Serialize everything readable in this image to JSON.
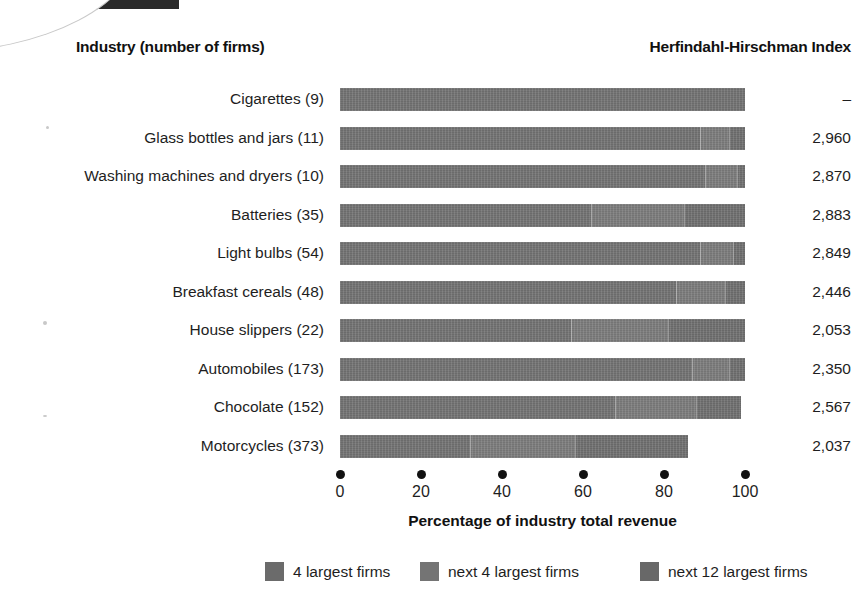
{
  "headers": {
    "industry": "Industry (number of firms)",
    "hhi": "Herfindahl-Hirschman Index"
  },
  "chart_data": {
    "type": "bar",
    "orientation": "horizontal",
    "stacked": true,
    "title": "",
    "xlabel": "Percentage of industry total revenue",
    "ylabel": "Industry (number of firms)",
    "xlim": [
      0,
      100
    ],
    "xticks": [
      0,
      20,
      40,
      60,
      80,
      100
    ],
    "xtick_labels": [
      "0",
      "20",
      "40",
      "60",
      "80",
      "100"
    ],
    "grid": false,
    "legend_position": "bottom",
    "legend": [
      "4 largest firms",
      "next 4 largest firms",
      "next 12 largest firms"
    ],
    "series": [
      {
        "name": "4 largest firms",
        "values": [
          100,
          89,
          90,
          62,
          89,
          83,
          57,
          87,
          68,
          32
        ]
      },
      {
        "name": "next 4 largest firms",
        "values": [
          0,
          7,
          8,
          23,
          8,
          12,
          24,
          9,
          20,
          26
        ]
      },
      {
        "name": "next 12 largest firms",
        "values": [
          0,
          4,
          2,
          15,
          3,
          5,
          19,
          4,
          11,
          28
        ]
      }
    ],
    "categories": [
      "Cigarettes  (9)",
      "Glass bottles and jars  (11)",
      "Washing machines and dryers  (10)",
      "Batteries  (35)",
      "Light bulbs  (54)",
      "Breakfast cereals  (48)",
      "House slippers  (22)",
      "Automobiles  (173)",
      "Chocolate  (152)",
      "Motorcycles  (373)"
    ],
    "totals": [
      100,
      100,
      100,
      100,
      100,
      100,
      100,
      100,
      99,
      86
    ],
    "hhi_values": [
      "–",
      "2,960",
      "2,870",
      "2,883",
      "2,849",
      "2,446",
      "2,053",
      "2,350",
      "2,567",
      "2,037"
    ],
    "colors": {
      "segment_1": "#6b6b6b",
      "segment_2": "#747474",
      "segment_3": "#686868",
      "text": "#1e1e1e",
      "background": "#ffffff"
    }
  },
  "rows": [
    {
      "label": "Cigarettes  (9)",
      "segments": [
        100,
        0,
        0
      ],
      "hhi": "–"
    },
    {
      "label": "Glass bottles and jars  (11)",
      "segments": [
        89,
        7,
        4
      ],
      "hhi": "2,960"
    },
    {
      "label": "Washing machines and dryers  (10)",
      "segments": [
        90,
        8,
        2
      ],
      "hhi": "2,870"
    },
    {
      "label": "Batteries  (35)",
      "segments": [
        62,
        23,
        15
      ],
      "hhi": "2,883"
    },
    {
      "label": "Light bulbs  (54)",
      "segments": [
        89,
        8,
        3
      ],
      "hhi": "2,849"
    },
    {
      "label": "Breakfast cereals  (48)",
      "segments": [
        83,
        12,
        5
      ],
      "hhi": "2,446"
    },
    {
      "label": "House slippers  (22)",
      "segments": [
        57,
        24,
        19
      ],
      "hhi": "2,053"
    },
    {
      "label": "Automobiles  (173)",
      "segments": [
        87,
        9,
        4
      ],
      "hhi": "2,350"
    },
    {
      "label": "Chocolate  (152)",
      "segments": [
        68,
        20,
        11
      ],
      "hhi": "2,567"
    },
    {
      "label": "Motorcycles  (373)",
      "segments": [
        32,
        26,
        28
      ],
      "hhi": "2,037"
    }
  ],
  "axis": {
    "ticks": [
      "0",
      "20",
      "40",
      "60",
      "80",
      "100"
    ],
    "title": "Percentage of industry total revenue"
  },
  "legend": [
    {
      "label": "4 largest firms"
    },
    {
      "label": "next 4 largest firms"
    },
    {
      "label": "next 12 largest firms"
    }
  ]
}
